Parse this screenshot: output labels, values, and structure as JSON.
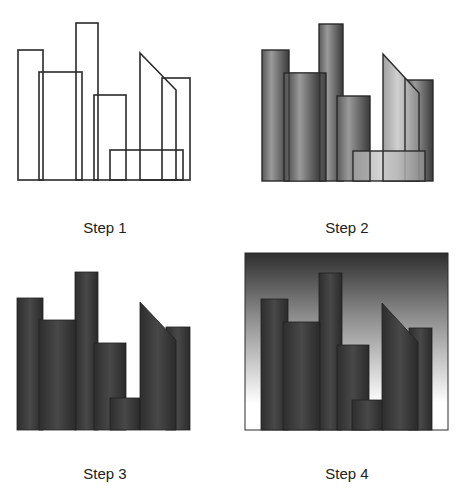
{
  "figure": {
    "panels": [
      {
        "id": "step-1",
        "label": "Step 1",
        "style": "outline"
      },
      {
        "id": "step-2",
        "label": "Step 2",
        "style": "gradient-fill-with-outline"
      },
      {
        "id": "step-3",
        "label": "Step 3",
        "style": "dark-fill"
      },
      {
        "id": "step-4",
        "label": "Step 4",
        "style": "dark-fill-with-gradient-sky"
      }
    ]
  },
  "colors": {
    "outline": "#2a2a2a",
    "building_dark": "#383838",
    "building_light": "#c8c8c8",
    "sky_top": "#2e2e2e",
    "sky_bottom": "#ffffff"
  }
}
